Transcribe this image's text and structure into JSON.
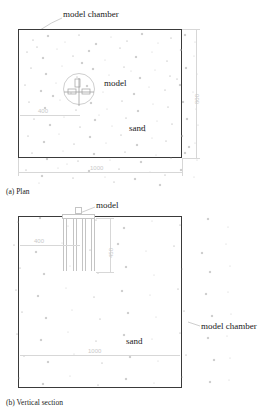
{
  "figure": {
    "title_plan": "(a) Plan",
    "title_section": "(b) Vertical section"
  },
  "plan": {
    "chamber_label": "model chamber",
    "model_label": "model",
    "sand_label": "sand",
    "dim_width": "1000",
    "dim_height": "800",
    "dim_offset": "400"
  },
  "section": {
    "chamber_label": "model chamber",
    "model_label": "model",
    "sand_label": "sand",
    "dim_width": "1000",
    "dim_depth": "450",
    "dim_offset": "400"
  },
  "colors": {
    "outline": "#3a3a3a",
    "dimension": "#c9c9c9",
    "text": "#1a1a1a",
    "sand_grain": "#9a9a9a",
    "background": "#ffffff"
  },
  "sand_grains_plan": [
    [
      14,
      10
    ],
    [
      29,
      6
    ],
    [
      46,
      12
    ],
    [
      60,
      5
    ],
    [
      77,
      14
    ],
    [
      92,
      7
    ],
    [
      108,
      11
    ],
    [
      123,
      4
    ],
    [
      139,
      13
    ],
    [
      152,
      8
    ],
    [
      166,
      5
    ],
    [
      176,
      12
    ],
    [
      8,
      22
    ],
    [
      24,
      28
    ],
    [
      38,
      19
    ],
    [
      54,
      26
    ],
    [
      70,
      21
    ],
    [
      86,
      30
    ],
    [
      101,
      18
    ],
    [
      117,
      27
    ],
    [
      133,
      22
    ],
    [
      148,
      31
    ],
    [
      162,
      20
    ],
    [
      175,
      26
    ],
    [
      12,
      38
    ],
    [
      27,
      44
    ],
    [
      43,
      36
    ],
    [
      58,
      47
    ],
    [
      74,
      39
    ],
    [
      90,
      45
    ],
    [
      105,
      37
    ],
    [
      121,
      48
    ],
    [
      136,
      40
    ],
    [
      151,
      46
    ],
    [
      167,
      38
    ],
    [
      178,
      44
    ],
    [
      6,
      55
    ],
    [
      22,
      61
    ],
    [
      37,
      53
    ],
    [
      52,
      63
    ],
    [
      68,
      56
    ],
    [
      84,
      62
    ],
    [
      99,
      54
    ],
    [
      115,
      64
    ],
    [
      130,
      57
    ],
    [
      146,
      60
    ],
    [
      161,
      55
    ],
    [
      174,
      62
    ],
    [
      10,
      72
    ],
    [
      26,
      78
    ],
    [
      41,
      70
    ],
    [
      57,
      80
    ],
    [
      72,
      73
    ],
    [
      88,
      79
    ],
    [
      103,
      71
    ],
    [
      119,
      81
    ],
    [
      134,
      74
    ],
    [
      149,
      77
    ],
    [
      164,
      72
    ],
    [
      177,
      79
    ],
    [
      15,
      89
    ],
    [
      31,
      95
    ],
    [
      45,
      87
    ],
    [
      61,
      97
    ],
    [
      76,
      90
    ],
    [
      93,
      96
    ],
    [
      107,
      88
    ],
    [
      123,
      98
    ],
    [
      138,
      91
    ],
    [
      153,
      94
    ],
    [
      168,
      89
    ],
    [
      179,
      95
    ],
    [
      9,
      106
    ],
    [
      25,
      112
    ],
    [
      40,
      104
    ],
    [
      55,
      114
    ],
    [
      71,
      107
    ],
    [
      87,
      113
    ],
    [
      102,
      105
    ],
    [
      118,
      115
    ],
    [
      133,
      108
    ],
    [
      147,
      111
    ],
    [
      163,
      106
    ],
    [
      176,
      113
    ],
    [
      13,
      123
    ],
    [
      28,
      129
    ],
    [
      44,
      121
    ],
    [
      59,
      131
    ],
    [
      75,
      124
    ],
    [
      91,
      130
    ],
    [
      106,
      122
    ],
    [
      122,
      132
    ],
    [
      137,
      125
    ],
    [
      152,
      128
    ],
    [
      166,
      123
    ],
    [
      178,
      130
    ],
    [
      7,
      140
    ],
    [
      23,
      146
    ],
    [
      39,
      138
    ],
    [
      54,
      148
    ],
    [
      70,
      141
    ],
    [
      86,
      147
    ],
    [
      100,
      139
    ],
    [
      116,
      149
    ],
    [
      131,
      142
    ],
    [
      146,
      145
    ],
    [
      162,
      140
    ],
    [
      175,
      147
    ],
    [
      18,
      17
    ],
    [
      63,
      33
    ],
    [
      112,
      41
    ],
    [
      158,
      49
    ],
    [
      34,
      66
    ],
    [
      80,
      85
    ],
    [
      126,
      101
    ],
    [
      170,
      117
    ],
    [
      48,
      134
    ],
    [
      95,
      152
    ],
    [
      141,
      155
    ],
    [
      20,
      153
    ]
  ],
  "sand_grains_section": [
    [
      18,
      222
    ],
    [
      40,
      218
    ],
    [
      68,
      226
    ],
    [
      96,
      220
    ],
    [
      124,
      228
    ],
    [
      152,
      221
    ],
    [
      180,
      225
    ],
    [
      208,
      219
    ],
    [
      228,
      227
    ],
    [
      14,
      245
    ],
    [
      36,
      252
    ],
    [
      62,
      243
    ],
    [
      90,
      250
    ],
    [
      118,
      244
    ],
    [
      146,
      251
    ],
    [
      174,
      246
    ],
    [
      202,
      253
    ],
    [
      226,
      244
    ],
    [
      20,
      268
    ],
    [
      44,
      274
    ],
    [
      70,
      266
    ],
    [
      98,
      273
    ],
    [
      126,
      267
    ],
    [
      154,
      275
    ],
    [
      182,
      269
    ],
    [
      210,
      272
    ],
    [
      230,
      266
    ],
    [
      16,
      290
    ],
    [
      38,
      296
    ],
    [
      66,
      288
    ],
    [
      94,
      297
    ],
    [
      122,
      291
    ],
    [
      150,
      295
    ],
    [
      178,
      289
    ],
    [
      206,
      294
    ],
    [
      228,
      292
    ],
    [
      22,
      312
    ],
    [
      46,
      318
    ],
    [
      72,
      310
    ],
    [
      100,
      319
    ],
    [
      128,
      313
    ],
    [
      156,
      317
    ],
    [
      184,
      311
    ],
    [
      212,
      316
    ],
    [
      231,
      314
    ],
    [
      17,
      334
    ],
    [
      41,
      340
    ],
    [
      68,
      332
    ],
    [
      96,
      341
    ],
    [
      124,
      335
    ],
    [
      152,
      339
    ],
    [
      180,
      333
    ],
    [
      208,
      338
    ],
    [
      227,
      336
    ],
    [
      24,
      356
    ],
    [
      48,
      362
    ],
    [
      74,
      354
    ],
    [
      102,
      363
    ],
    [
      130,
      357
    ],
    [
      158,
      361
    ],
    [
      186,
      355
    ],
    [
      214,
      360
    ],
    [
      230,
      358
    ],
    [
      19,
      378
    ],
    [
      43,
      384
    ],
    [
      70,
      376
    ],
    [
      98,
      385
    ],
    [
      126,
      379
    ],
    [
      154,
      383
    ],
    [
      182,
      377
    ],
    [
      210,
      382
    ],
    [
      229,
      380
    ]
  ]
}
